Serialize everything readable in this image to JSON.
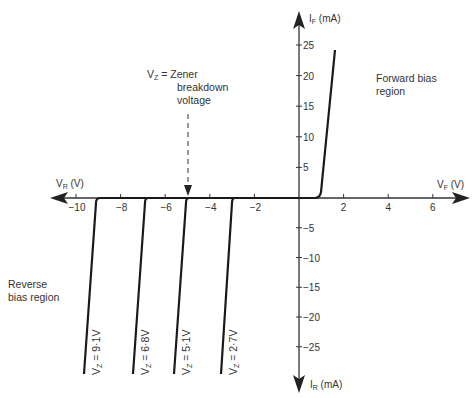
{
  "chart_data": {
    "type": "line",
    "title": "",
    "xlabel_positive": "V_F (V)",
    "xlabel_negative": "V_R (V)",
    "ylabel_positive": "I_F (mA)",
    "ylabel_negative": "I_R (mA)",
    "x_ticks": [
      -10,
      -8,
      -6,
      -4,
      -2,
      2,
      4,
      6
    ],
    "x_tick_labels": [
      "−10",
      "−8",
      "−6",
      "−4",
      "−2",
      "2",
      "4",
      "6"
    ],
    "y_ticks_positive": [
      5,
      10,
      15,
      20,
      25
    ],
    "y_ticks_negative": [
      -5,
      -10,
      -15,
      -20,
      -25
    ],
    "y_tick_labels_positive": [
      "5",
      "10",
      "15",
      "20",
      "25"
    ],
    "y_tick_labels_negative": [
      "−5",
      "−10",
      "−15",
      "−20",
      "−25"
    ],
    "xlim": [
      -11,
      7
    ],
    "ylim": [
      -32,
      30
    ],
    "grid": false,
    "series": [
      {
        "name": "Forward bias",
        "x": [
          0,
          0.8,
          1.0,
          1.6
        ],
        "y": [
          0,
          0,
          1,
          25
        ]
      },
      {
        "name": "Vz = 9·1V",
        "label": "V_Z = 9·1V",
        "x": [
          0,
          -9.1,
          -9.3,
          -9.7
        ],
        "y": [
          0,
          0,
          -1,
          -29
        ]
      },
      {
        "name": "Vz = 6·8V",
        "label": "V_Z = 6·8V",
        "x": [
          0,
          -6.8,
          -7.0,
          -7.4
        ],
        "y": [
          0,
          0,
          -1,
          -29
        ]
      },
      {
        "name": "Vz = 5·1V",
        "label": "V_Z = 5·1V",
        "x": [
          0,
          -5.1,
          -5.3,
          -5.7
        ],
        "y": [
          0,
          0,
          -1,
          -29
        ]
      },
      {
        "name": "Vz = 2·7V",
        "label": "V_Z = 2·7V",
        "x": [
          0,
          -2.7,
          -2.9,
          -3.2
        ],
        "y": [
          0,
          0,
          -1,
          -29
        ]
      }
    ],
    "annotations": [
      {
        "text": [
          "V_Z = Zener",
          "breakdown",
          "voltage"
        ],
        "arrow_to_x": -5.1
      },
      {
        "text": [
          "Forward bias",
          "region"
        ]
      },
      {
        "text": [
          "Reverse",
          "bias region"
        ]
      }
    ]
  },
  "labels": {
    "vf": "V",
    "vf_sub": "F",
    "vf_unit": " (V)",
    "vr": "V",
    "vr_sub": "R",
    "vr_unit": " (V)",
    "if": "I",
    "if_sub": "F",
    "if_unit": " (mA)",
    "ir": "I",
    "ir_sub": "R",
    "ir_unit": " (mA)",
    "zener_l1_v": "V",
    "zener_l1_sub": "Z",
    "zener_l1_rest": " = Zener",
    "zener_l2": "breakdown",
    "zener_l3": "voltage",
    "fwd_l1": "Forward bias",
    "fwd_l2": "region",
    "rev_l1": "Reverse",
    "rev_l2": "bias region",
    "curve_labels": [
      {
        "v": "V",
        "sub": "Z",
        "rest": " = 9·1V"
      },
      {
        "v": "V",
        "sub": "Z",
        "rest": " = 6·8V"
      },
      {
        "v": "V",
        "sub": "Z",
        "rest": " = 5·1V"
      },
      {
        "v": "V",
        "sub": "Z",
        "rest": " = 2·7V"
      }
    ]
  },
  "colors": {
    "axis": "#333333",
    "curve": "#1a1a1a",
    "text": "#333333"
  }
}
